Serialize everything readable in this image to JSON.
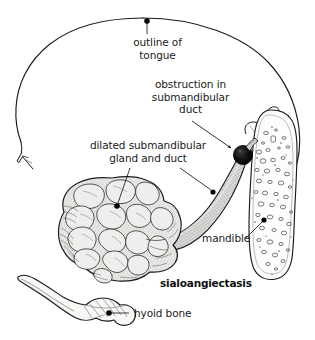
{
  "figure": {
    "title": "sialoangiectasis",
    "width": 315,
    "height": 340,
    "background_color": "#ffffff",
    "ink_color": "#1a1a1a"
  },
  "caption": {
    "text": "sialoangiectasis"
  },
  "labels": {
    "tongue": {
      "line1": "outline of",
      "line2": "tongue",
      "full": "outline of tongue"
    },
    "obstruction": {
      "line1": "obstruction in",
      "line2": "submandibular",
      "line3": "duct",
      "full": "obstruction in submandibular duct"
    },
    "gland": {
      "line1": "dilated submandibular",
      "line2": "gland and duct",
      "full": "dilated submandibular gland and duct"
    },
    "mandible": {
      "text": "mandible"
    },
    "hyoid": {
      "text": "hyoid bone"
    }
  },
  "structures": [
    {
      "name": "outline-of-tongue",
      "kind": "outline-curve",
      "fill": "none",
      "stroke": "#1a1a1a"
    },
    {
      "name": "submandibular-gland",
      "kind": "lobulated-mass",
      "fill": "#e8e8e6",
      "stroke": "#1a1a1a"
    },
    {
      "name": "submandibular-duct",
      "kind": "dilated-tube",
      "fill": "#dedede",
      "stroke": "#1a1a1a"
    },
    {
      "name": "obstruction",
      "kind": "solid-sphere",
      "fill": "#000000",
      "stroke": "#000000"
    },
    {
      "name": "mandible",
      "kind": "bone-section-trabecular",
      "fill": "#ffffff",
      "stroke": "#1a1a1a"
    },
    {
      "name": "hyoid-bone",
      "kind": "bone",
      "fill": "#f6f6f4",
      "stroke": "#1a1a1a"
    }
  ],
  "leaders": [
    {
      "name": "leader-tongue",
      "style": "dot",
      "target": "tongue apex"
    },
    {
      "name": "leader-obstruction",
      "style": "arrow",
      "target": "obstruction sphere"
    },
    {
      "name": "leader-gland",
      "style": "dot",
      "target": "gland body"
    },
    {
      "name": "leader-duct",
      "style": "dot",
      "target": "dilated duct"
    },
    {
      "name": "leader-mandible",
      "style": "dot",
      "target": "mandible ramus"
    },
    {
      "name": "leader-hyoid",
      "style": "dot",
      "target": "hyoid body"
    }
  ],
  "colors": {
    "ink": "#1a1a1a",
    "obstruction": "#000000",
    "gland_fill": "#e8e8e6",
    "duct_fill": "#dedede",
    "bone_fill": "#fbfbf9"
  }
}
